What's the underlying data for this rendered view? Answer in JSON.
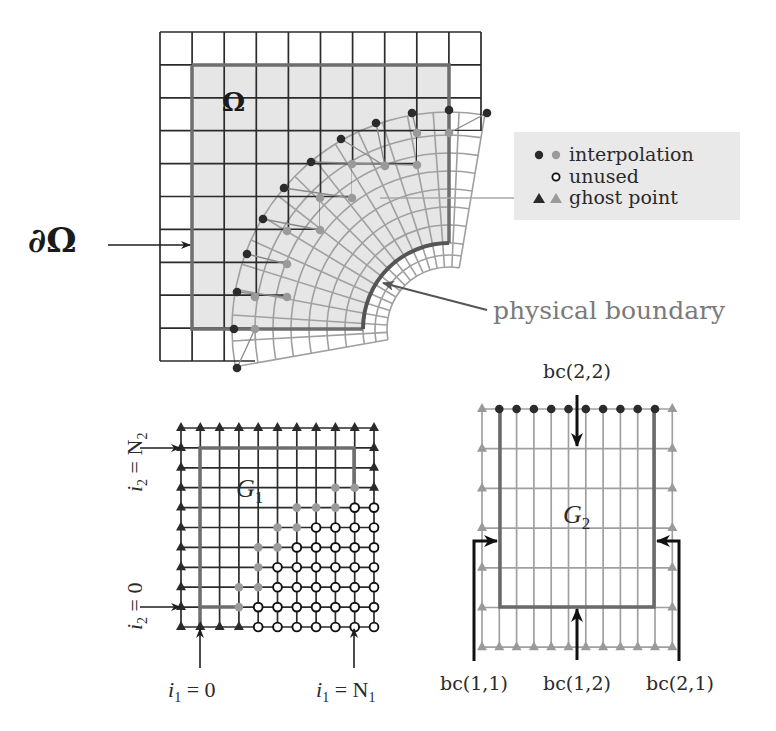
{
  "figure": {
    "top_panel": {
      "domain_label": "Ω",
      "boundary_label": "∂Ω",
      "physical_boundary_label": "physical boundary",
      "legend": {
        "items": [
          {
            "label": "interpolation",
            "markers": [
              "black-dot",
              "gray-dot"
            ]
          },
          {
            "label": "unused",
            "markers": [
              "open-circle"
            ]
          },
          {
            "label": "ghost point",
            "markers": [
              "black-triangle",
              "gray-triangle"
            ]
          }
        ]
      }
    },
    "grid_g1": {
      "title_main": "G",
      "title_sub": "1",
      "label_i2_top_main": "i",
      "label_i2_top_sub": "2",
      "label_i2_top_rhs": " = N",
      "label_i2_top_rhs_sub": "2",
      "label_i2_bottom_main": "i",
      "label_i2_bottom_sub": "2",
      "label_i2_bottom_rhs": " = 0",
      "label_i1_left_main": "i",
      "label_i1_left_sub": "1",
      "label_i1_left_rhs": " = 0",
      "label_i1_right_main": "i",
      "label_i1_right_sub": "1",
      "label_i1_right_rhs": " = N",
      "label_i1_right_rhs_sub": "1"
    },
    "grid_g2": {
      "title_main": "G",
      "title_sub": "2",
      "bc_top": "bc(2,2)",
      "bc_left": "bc(1,1)",
      "bc_bottom": "bc(1,2)",
      "bc_right": "bc(2,1)"
    },
    "colors": {
      "dark": "#2b2b2b",
      "gray": "#9a9a9a",
      "boundary_gray": "#6e6e6e",
      "shade": "#e6e6e6",
      "legend_bg": "#e9e9e9"
    }
  }
}
